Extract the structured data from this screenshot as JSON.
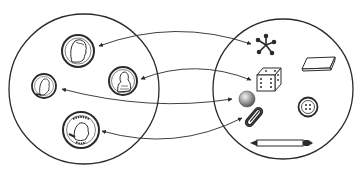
{
  "diagram": {
    "type": "mapping",
    "colors": {
      "stroke": "#2a2a2a",
      "background": "#ffffff",
      "fill_gray": "#9a9a9a"
    },
    "sets": [
      {
        "id": "coins",
        "label": "Coins",
        "circle": {
          "cx": 84,
          "cy": 89,
          "r": 75
        },
        "members": [
          {
            "id": "nickel",
            "label": "Nickel",
            "cx": 78,
            "cy": 51,
            "r": 16
          },
          {
            "id": "penny",
            "label": "Penny",
            "cx": 123,
            "cy": 81,
            "r": 14
          },
          {
            "id": "dime",
            "label": "Dime",
            "cx": 44,
            "cy": 86,
            "r": 12
          },
          {
            "id": "quarter",
            "label": "Quarter",
            "cx": 81,
            "cy": 130,
            "r": 18
          }
        ]
      },
      {
        "id": "objects",
        "label": "Objects",
        "circle": {
          "cx": 283,
          "cy": 89,
          "r": 70
        },
        "members": [
          {
            "id": "jack",
            "label": "Jack",
            "cx": 266,
            "cy": 45
          },
          {
            "id": "eraser",
            "label": "Eraser",
            "cx": 320,
            "cy": 62
          },
          {
            "id": "die",
            "label": "Die",
            "cx": 266,
            "cy": 81
          },
          {
            "id": "marble",
            "label": "Marble",
            "cx": 247,
            "cy": 100
          },
          {
            "id": "button",
            "label": "Button",
            "cx": 308,
            "cy": 106
          },
          {
            "id": "paperclip",
            "label": "Paper clip",
            "cx": 254,
            "cy": 117
          },
          {
            "id": "pencil",
            "label": "Pencil",
            "cx": 282,
            "cy": 143
          }
        ]
      }
    ],
    "arrows": [
      {
        "from": "nickel",
        "to": "jack",
        "double_headed": true,
        "path": "M99,46 Q175,18 251,44"
      },
      {
        "from": "penny",
        "to": "die",
        "double_headed": true,
        "path": "M141,79 Q195,58 251,80"
      },
      {
        "from": "dime",
        "to": "marble",
        "double_headed": true,
        "path": "M62,89 Q150,112 232,99"
      },
      {
        "from": "quarter",
        "to": "paperclip",
        "double_headed": true,
        "path": "M102,131 Q175,152 242,118"
      }
    ]
  }
}
